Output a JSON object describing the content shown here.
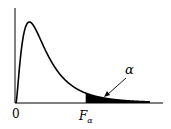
{
  "chart_data": {
    "type": "area",
    "title": "",
    "xlabel": "",
    "ylabel": "",
    "x_tick_labels": [
      "0",
      "F_α"
    ],
    "origin_label": "0",
    "critical_label": {
      "main": "F",
      "sub": "α"
    },
    "tail_label": "α",
    "distribution": {
      "name": "F",
      "d1": 5,
      "d2": 10
    },
    "xlim": [
      0,
      5
    ],
    "critical_value": 2.6,
    "shaded_region": "right-tail"
  }
}
